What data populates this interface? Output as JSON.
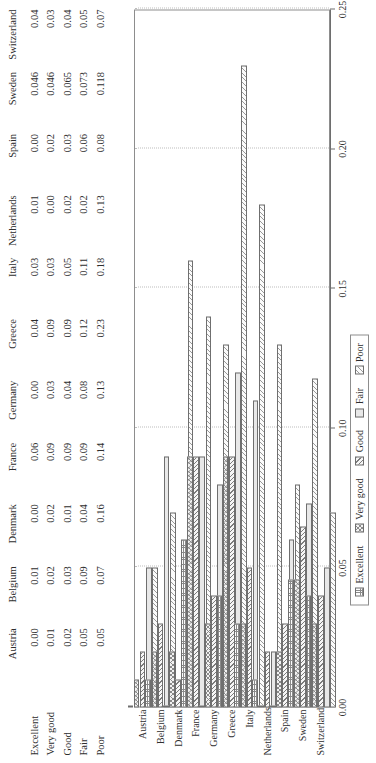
{
  "figure": {
    "categories": [
      "Austria",
      "Belgium",
      "Denmark",
      "France",
      "Germany",
      "Greece",
      "Italy",
      "Netherlands",
      "Spain",
      "Sweden",
      "Switzerland"
    ],
    "series_names": [
      "Excellent",
      "Very good",
      "Good",
      "Fair",
      "Poor"
    ]
  },
  "table": {
    "row_headers": [
      "Excellent",
      "Very good",
      "Good",
      "Fair",
      "Poor"
    ],
    "column_headers": [
      "Austria",
      "Belgium",
      "Denmark",
      "France",
      "Germany",
      "Greece",
      "Italy",
      "Netherlands",
      "Spain",
      "Sweden",
      "Switzerland"
    ],
    "rows": [
      [
        "0.00",
        "0.01",
        "0.00",
        "0.06",
        "0.00",
        "0.04",
        "0.03",
        "0.01",
        "0.00",
        "0.046",
        "0.04"
      ],
      [
        "0.01",
        "0.02",
        "0.02",
        "0.09",
        "0.03",
        "0.09",
        "0.03",
        "0.00",
        "0.02",
        "0.046",
        "0.03"
      ],
      [
        "0.02",
        "0.03",
        "0.01",
        "0.09",
        "0.04",
        "0.09",
        "0.05",
        "0.02",
        "0.03",
        "0.065",
        "0.04"
      ],
      [
        "0.05",
        "0.09",
        "0.04",
        "0.09",
        "0.08",
        "0.12",
        "0.11",
        "0.02",
        "0.06",
        "0.073",
        "0.05"
      ],
      [
        "0.05",
        "0.07",
        "0.16",
        "0.14",
        "0.13",
        "0.23",
        "0.18",
        "0.13",
        "0.08",
        "0.118",
        "0.07"
      ]
    ]
  },
  "axis": {
    "tick_labels": [
      "0.25",
      "0.20",
      "0.15",
      "0.10",
      "0.05",
      "0.00"
    ],
    "tick_values": [
      0.25,
      0.2,
      0.15,
      0.1,
      0.05,
      0.0
    ]
  },
  "legend": {
    "items": [
      {
        "label": "Excellent",
        "pattern": "grid-hatch"
      },
      {
        "label": "Very good",
        "pattern": "cross-hatch"
      },
      {
        "label": "Good",
        "pattern": "diagonal-hatch"
      },
      {
        "label": "Fair",
        "pattern": "solid-light"
      },
      {
        "label": "Poor",
        "pattern": "reverse-diagonal-hatch"
      }
    ]
  },
  "chart_data": {
    "type": "bar",
    "title": "",
    "xlabel": "",
    "ylabel": "",
    "ylim": [
      0,
      0.25
    ],
    "grid": true,
    "legend_position": "bottom",
    "orientation": "vertical-grouped",
    "categories": [
      "Austria",
      "Belgium",
      "Denmark",
      "France",
      "Germany",
      "Greece",
      "Italy",
      "Netherlands",
      "Spain",
      "Sweden",
      "Switzerland"
    ],
    "series": [
      {
        "name": "Excellent",
        "values": [
          0.0,
          0.01,
          0.0,
          0.06,
          0.0,
          0.04,
          0.03,
          0.01,
          0.0,
          0.046,
          0.04
        ]
      },
      {
        "name": "Very good",
        "values": [
          0.01,
          0.02,
          0.02,
          0.09,
          0.03,
          0.09,
          0.03,
          0.0,
          0.02,
          0.046,
          0.03
        ]
      },
      {
        "name": "Good",
        "values": [
          0.02,
          0.03,
          0.01,
          0.09,
          0.04,
          0.09,
          0.05,
          0.02,
          0.03,
          0.065,
          0.04
        ]
      },
      {
        "name": "Fair",
        "values": [
          0.05,
          0.09,
          0.04,
          0.09,
          0.08,
          0.12,
          0.11,
          0.02,
          0.06,
          0.073,
          0.05
        ]
      },
      {
        "name": "Poor",
        "values": [
          0.05,
          0.07,
          0.16,
          0.14,
          0.13,
          0.23,
          0.18,
          0.13,
          0.08,
          0.118,
          0.07
        ]
      }
    ],
    "tick_labels": [
      "0.00",
      "0.05",
      "0.10",
      "0.15",
      "0.20",
      "0.25"
    ]
  }
}
